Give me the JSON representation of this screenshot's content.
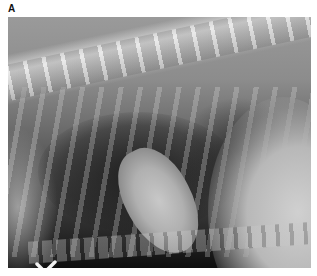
{
  "figure": {
    "panel_label": "A",
    "image_description": "Lateral thoracic radiograph",
    "marker_symbol": "V-shaped orientation marker"
  },
  "colors": {
    "background": "#ffffff",
    "label": "#111111",
    "radiograph_dark": "#0e0e0e",
    "radiograph_light": "#d0d0d0"
  }
}
